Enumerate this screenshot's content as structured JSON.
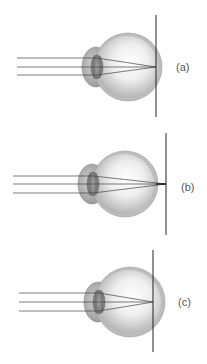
{
  "figure": {
    "colors": {
      "sclera_outer": "#bdbdbd",
      "sclera_inner": "#d6d6d6",
      "vitreous_light": "#f7f7f7",
      "vitreous_dark": "#a8a8a8",
      "cornea": "#b0b0b0",
      "lens": "#8c8c8c",
      "ray": "#444444",
      "image_plane": "#222222",
      "label": "#555555"
    },
    "panels": [
      {
        "id": "a",
        "label": "(a)",
        "eye_center": [
          128,
          67
        ],
        "eye_radius": 34,
        "cornea_center": [
          96,
          67
        ],
        "rays_y": [
          58,
          67,
          75
        ],
        "ray_start_x": 17,
        "lens_x": 97,
        "focus_x": 156,
        "image_plane_x": 156,
        "image_plane_y": [
          15,
          117
        ],
        "label_pos": [
          176,
          71
        ]
      },
      {
        "id": "b",
        "label": "(b)",
        "eye_center": [
          125,
          184
        ],
        "eye_radius": 33,
        "cornea_center": [
          92,
          184
        ],
        "rays_y": [
          176,
          184,
          193
        ],
        "ray_start_x": 13,
        "lens_x": 93,
        "focus_x": 166,
        "image_plane_x": 166,
        "image_plane_y": [
          133,
          235
        ],
        "label_pos": [
          181,
          191
        ]
      },
      {
        "id": "c",
        "label": "(c)",
        "eye_center": [
          130,
          302
        ],
        "eye_radius": 35,
        "cornea_center": [
          98,
          302
        ],
        "rays_y": [
          293,
          302,
          311
        ],
        "ray_start_x": 19,
        "lens_x": 99,
        "focus_x": 153,
        "image_plane_x": 153,
        "image_plane_y": [
          250,
          352
        ],
        "label_pos": [
          178,
          306
        ]
      }
    ]
  }
}
